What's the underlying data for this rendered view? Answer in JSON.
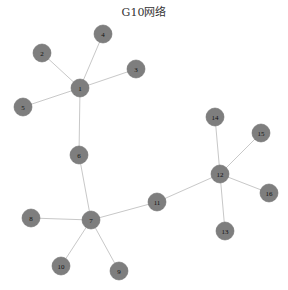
{
  "title": "G10网络",
  "colors": {
    "node_fill": "#7e7e7e",
    "edge": "#c8c8c8",
    "background": "#ffffff"
  },
  "nodes": [
    {
      "id": "1",
      "x": 80,
      "y": 88
    },
    {
      "id": "2",
      "x": 42,
      "y": 53
    },
    {
      "id": "3",
      "x": 136,
      "y": 69
    },
    {
      "id": "4",
      "x": 103,
      "y": 34
    },
    {
      "id": "5",
      "x": 23,
      "y": 107
    },
    {
      "id": "6",
      "x": 79,
      "y": 155
    },
    {
      "id": "7",
      "x": 91,
      "y": 220
    },
    {
      "id": "8",
      "x": 31,
      "y": 218
    },
    {
      "id": "9",
      "x": 119,
      "y": 271
    },
    {
      "id": "10",
      "x": 61,
      "y": 266
    },
    {
      "id": "11",
      "x": 157,
      "y": 202
    },
    {
      "id": "12",
      "x": 220,
      "y": 174
    },
    {
      "id": "13",
      "x": 225,
      "y": 231
    },
    {
      "id": "14",
      "x": 215,
      "y": 117
    },
    {
      "id": "15",
      "x": 261,
      "y": 133
    },
    {
      "id": "16",
      "x": 269,
      "y": 193
    }
  ],
  "edges": [
    [
      "1",
      "2"
    ],
    [
      "1",
      "3"
    ],
    [
      "1",
      "4"
    ],
    [
      "1",
      "5"
    ],
    [
      "1",
      "6"
    ],
    [
      "6",
      "7"
    ],
    [
      "7",
      "8"
    ],
    [
      "7",
      "9"
    ],
    [
      "7",
      "10"
    ],
    [
      "7",
      "11"
    ],
    [
      "11",
      "12"
    ],
    [
      "12",
      "13"
    ],
    [
      "12",
      "14"
    ],
    [
      "12",
      "15"
    ],
    [
      "12",
      "16"
    ]
  ]
}
